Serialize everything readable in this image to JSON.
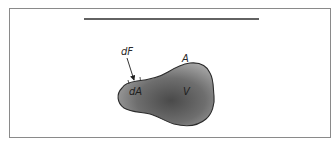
{
  "figure": {
    "type": "control-volume-diagram",
    "labels": {
      "force": "dF",
      "area_element": "dA",
      "surface": "A",
      "volume": "V"
    },
    "colors": {
      "frame": "#8a8a8a",
      "body_fill_dark": "#4a4a4a",
      "body_fill_light": "#a8a8a8",
      "outline": "#2b2b2b",
      "flow_lines": "#3a3a3a"
    },
    "flow_lines_count": 8
  }
}
